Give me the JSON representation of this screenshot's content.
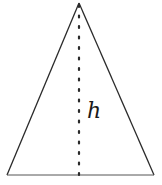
{
  "diagram": {
    "shape": "triangle",
    "height_label": "h",
    "colors": {
      "stroke": "#2a2a2a",
      "dots": "#2a2a2a",
      "background": "#ffffff"
    },
    "vertices": {
      "apex": [
        79,
        3
      ],
      "base_left": [
        7,
        175
      ],
      "base_right": [
        154,
        175
      ]
    }
  }
}
